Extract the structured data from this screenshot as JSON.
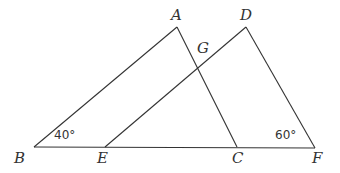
{
  "diagram": {
    "type": "geometry",
    "points": {
      "A": {
        "label": "A",
        "x": 177,
        "y": 27
      },
      "B": {
        "label": "B",
        "x": 34,
        "y": 147
      },
      "C": {
        "label": "C",
        "x": 237,
        "y": 147
      },
      "D": {
        "label": "D",
        "x": 246,
        "y": 27
      },
      "E": {
        "label": "E",
        "x": 105,
        "y": 147
      },
      "F": {
        "label": "F",
        "x": 315,
        "y": 148
      },
      "G": {
        "label": "G",
        "x": 199,
        "y": 66
      }
    },
    "segments": [
      [
        "B",
        "A"
      ],
      [
        "A",
        "C"
      ],
      [
        "B",
        "F"
      ],
      [
        "E",
        "D"
      ],
      [
        "D",
        "F"
      ]
    ],
    "angles": {
      "B": {
        "label": "40°",
        "value": 40
      },
      "F": {
        "label": "60°",
        "value": 60
      }
    }
  }
}
